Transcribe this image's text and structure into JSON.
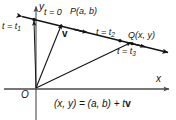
{
  "figure": {
    "axes": {
      "y_label": "y",
      "x_label": "x",
      "origin_label": "O"
    },
    "line_labels": {
      "t1": "t = t",
      "t1_sub": "1",
      "t0": "t = 0",
      "t2": "t = t",
      "t2_sub": "2",
      "t3": "t = t",
      "t3_sub": "3"
    },
    "points": {
      "P": "P(a, b)",
      "Q": "Q(x, y)"
    },
    "vector_label": "v",
    "equation": {
      "lhs": "(x, y) = (a, b) + t",
      "vec": "v"
    },
    "colors": {
      "stroke": "#141414",
      "background": "#ffffff",
      "axis": "#4a4a4a"
    }
  }
}
